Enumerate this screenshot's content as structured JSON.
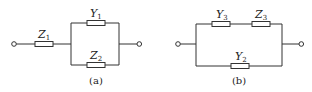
{
  "diagram": {
    "type": "circuit-schematic",
    "colors": {
      "wire": "#333333",
      "background": "#ffffff"
    },
    "circuits": [
      {
        "id": "a",
        "caption": "(a)",
        "components": [
          {
            "id": "Z1",
            "symbol": "Z",
            "subscript": "1",
            "position": "series-input"
          },
          {
            "id": "Y1",
            "symbol": "Y",
            "subscript": "1",
            "position": "parallel-top"
          },
          {
            "id": "Z2",
            "symbol": "Z",
            "subscript": "2",
            "position": "parallel-bottom"
          }
        ],
        "description": "Z1 in series with parallel combination of Y1 and Z2"
      },
      {
        "id": "b",
        "caption": "(b)",
        "components": [
          {
            "id": "Y3",
            "symbol": "Y",
            "subscript": "3",
            "position": "top-branch-left"
          },
          {
            "id": "Z3",
            "symbol": "Z",
            "subscript": "3",
            "position": "top-branch-right"
          },
          {
            "id": "Y2",
            "symbol": "Y",
            "subscript": "2",
            "position": "bottom-branch"
          }
        ],
        "description": "Series Y3-Z3 branch in parallel with Y2"
      }
    ]
  }
}
